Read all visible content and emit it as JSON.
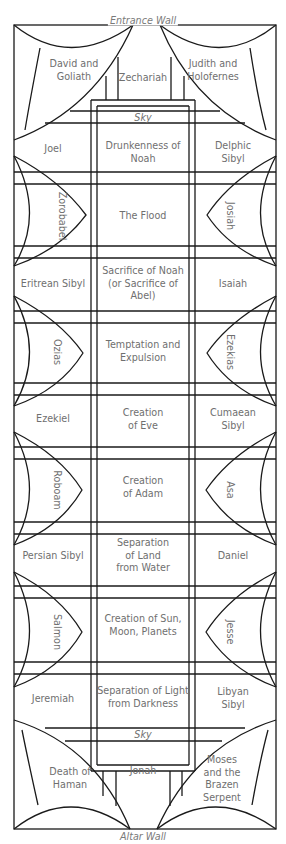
{
  "walls": {
    "top": "Entrance Wall",
    "bottom": "Altar Wall"
  },
  "sky": {
    "top": "Sky",
    "bottom": "Sky"
  },
  "corners": {
    "top_left": "David and\nGoliath",
    "top_right": "Judith and\nHolofernes",
    "bottom_left": "Death of\nHaman",
    "bottom_right": "Moses\nand the\nBrazen\nSerpent"
  },
  "ends": {
    "top": "Zechariah",
    "bottom": "Jonah"
  },
  "rows": [
    {
      "left": "Joel",
      "center": "Drunkenness of\nNoah",
      "right": "Delphic\nSibyl"
    },
    {
      "left": "Zorobabel",
      "center": "The Flood",
      "right": "Josiah",
      "lunette": true
    },
    {
      "left": "Eritrean Sibyl",
      "center": "Sacrifice of Noah\n(or Sacrifice of\nAbel)",
      "right": "Isaiah"
    },
    {
      "left": "Ozias",
      "center": "Temptation and\nExpulsion",
      "right": "Ezekias",
      "lunette": true
    },
    {
      "left": "Ezekiel",
      "center": "Creation\nof Eve",
      "right": "Cumaean Sibyl"
    },
    {
      "left": "Roboam",
      "center": "Creation\nof Adam",
      "right": "Asa",
      "lunette": true
    },
    {
      "left": "Persian Sibyl",
      "center": "Separation\nof Land\nfrom Water",
      "right": "Daniel"
    },
    {
      "left": "Salmon",
      "center": "Creation of Sun,\nMoon, Planets",
      "right": "Jesse",
      "lunette": true
    },
    {
      "left": "Jeremiah",
      "center": "Separation of Light\nfrom Darkness",
      "right": "Libyan Sibyl"
    }
  ],
  "colors": {
    "line": "#1a1a1a",
    "text": "#6f6f6f",
    "background": "#ffffff"
  }
}
